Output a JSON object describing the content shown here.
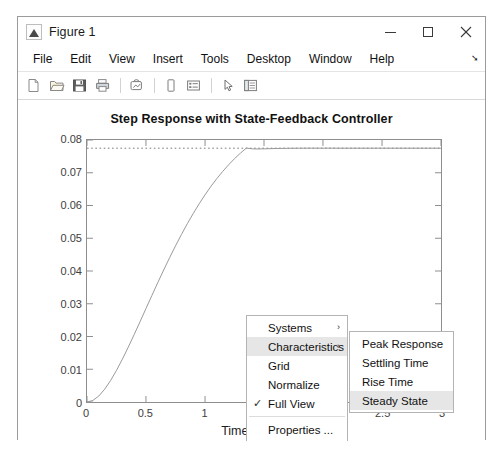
{
  "window": {
    "title": "Figure 1",
    "icon": "matlab-figure-icon",
    "controls": {
      "minimize": "minimize-icon",
      "maximize": "maximize-icon",
      "close": "✕"
    }
  },
  "menubar": {
    "items": [
      {
        "label": "File"
      },
      {
        "label": "Edit"
      },
      {
        "label": "View"
      },
      {
        "label": "Insert"
      },
      {
        "label": "Tools"
      },
      {
        "label": "Desktop"
      },
      {
        "label": "Window"
      },
      {
        "label": "Help"
      }
    ],
    "overflow": "➘"
  },
  "toolbar": {
    "buttons": [
      {
        "name": "new-figure-icon"
      },
      {
        "name": "open-file-icon"
      },
      {
        "name": "save-figure-icon"
      },
      {
        "name": "print-figure-icon"
      },
      {
        "name": "link-plot-icon"
      },
      {
        "name": "insert-colorbar-icon"
      },
      {
        "name": "insert-legend-icon"
      },
      {
        "name": "edit-plot-arrow-icon"
      },
      {
        "name": "show-plot-tools-icon"
      }
    ]
  },
  "context_menu": {
    "main": {
      "items": [
        {
          "label": "Systems",
          "submenu": true,
          "checked": false,
          "highlight": false
        },
        {
          "label": "Characteristics",
          "submenu": true,
          "checked": false,
          "highlight": true
        },
        {
          "label": "Grid",
          "submenu": false,
          "checked": false,
          "highlight": false
        },
        {
          "label": "Normalize",
          "submenu": false,
          "checked": false,
          "highlight": false
        },
        {
          "label": "Full View",
          "submenu": false,
          "checked": true,
          "highlight": false
        },
        {
          "label": "Properties ...",
          "submenu": false,
          "checked": false,
          "highlight": false
        }
      ],
      "separator_after_index": 4,
      "submenu_arrow": "›",
      "check_glyph": "✓"
    },
    "submenu": {
      "items": [
        {
          "label": "Peak Response",
          "highlight": false
        },
        {
          "label": "Settling Time",
          "highlight": false
        },
        {
          "label": "Rise Time",
          "highlight": false
        },
        {
          "label": "Steady State",
          "highlight": true
        }
      ]
    }
  },
  "chart_data": {
    "type": "line",
    "title": "Step Response with State-Feedback Controller",
    "xlabel": "Time (seconds)",
    "ylabel": "Amplitude",
    "xlim": [
      0,
      3
    ],
    "ylim": [
      0,
      0.08
    ],
    "xticks": [
      0,
      0.5,
      1,
      1.5,
      2,
      2.5,
      3
    ],
    "xtick_labels": [
      "0",
      "0.5",
      "1",
      "1.5",
      "2",
      "2.5",
      "3"
    ],
    "yticks": [
      0,
      0.01,
      0.02,
      0.03,
      0.04,
      0.05,
      0.06,
      0.07,
      0.08
    ],
    "ytick_labels": [
      "0",
      "0.01",
      "0.02",
      "0.03",
      "0.04",
      "0.05",
      "0.06",
      "0.07",
      "0.08"
    ],
    "grid": false,
    "legend": null,
    "box": true,
    "line_color": "#999999",
    "annotation_color": "#7a7a7a",
    "series": [
      {
        "name": "Step Response",
        "color": "#999999",
        "style": "solid",
        "x": [
          0,
          0.05,
          0.1,
          0.15,
          0.2,
          0.25,
          0.3,
          0.35,
          0.4,
          0.45,
          0.5,
          0.55,
          0.6,
          0.65,
          0.7,
          0.75,
          0.8,
          0.85,
          0.9,
          0.95,
          1.0,
          1.05,
          1.1,
          1.15,
          1.2,
          1.25,
          1.3,
          1.35,
          1.4,
          1.45,
          1.5,
          1.6,
          1.7,
          1.8,
          1.9,
          2.0,
          2.2,
          2.4,
          2.6,
          2.8,
          3.0
        ],
        "y": [
          0,
          0.00048,
          0.00184,
          0.00392,
          0.00656,
          0.00966,
          0.01309,
          0.01677,
          0.02062,
          0.02456,
          0.02855,
          0.03253,
          0.03646,
          0.04031,
          0.04406,
          0.04767,
          0.05113,
          0.05443,
          0.05755,
          0.06049,
          0.06325,
          0.06582,
          0.0682,
          0.0704,
          0.07243,
          0.07429,
          0.07598,
          0.07753,
          0.07731,
          0.07726,
          0.07731,
          0.0774,
          0.07746,
          0.0775,
          0.07751,
          0.07751,
          0.0775,
          0.0775,
          0.0775,
          0.0775,
          0.0775
        ]
      }
    ],
    "annotations": [
      {
        "name": "steady-state-line",
        "type": "hline",
        "y": 0.0775,
        "style": "dotted",
        "color": "#7a7a7a",
        "label": "Steady State"
      }
    ]
  }
}
